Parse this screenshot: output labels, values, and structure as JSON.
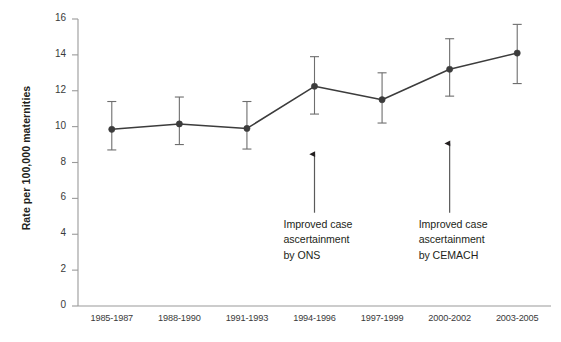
{
  "chart_data": {
    "type": "line",
    "title": "",
    "xlabel": "",
    "ylabel": "Rate per 100,000 maternities",
    "categories": [
      "1985-1987",
      "1988-1990",
      "1991-1993",
      "1994-1996",
      "1997-1999",
      "2000-2002",
      "2003-2005"
    ],
    "values": [
      9.85,
      10.15,
      9.9,
      12.25,
      11.5,
      13.2,
      14.1
    ],
    "errors_low": [
      8.7,
      9.0,
      8.75,
      10.7,
      10.2,
      11.7,
      12.4
    ],
    "errors_high": [
      11.4,
      11.65,
      11.4,
      13.9,
      13.0,
      14.9,
      15.7
    ],
    "ylim": [
      0,
      16
    ],
    "yticks": [
      0,
      2,
      4,
      6,
      8,
      10,
      12,
      14,
      16
    ],
    "ytick_labels": [
      "0",
      "2",
      "4",
      "6",
      "8",
      "10",
      "12",
      "14",
      "16"
    ],
    "grid": false,
    "legend": null,
    "series_color": "#3c3c3c",
    "marker": "filled-circle",
    "errorbar_style": "capped-vertical",
    "annotations": [
      {
        "id": "ons",
        "text": "Improved case\nascertainment\nby ONS",
        "target_category": "1994-1996",
        "arrow_from_value": 5.2,
        "arrow_to_value": 8.8
      },
      {
        "id": "cemach",
        "text": "Improved case\nascertainment\nby CEMACH",
        "target_category": "2000-2002",
        "arrow_from_value": 5.2,
        "arrow_to_value": 9.4
      }
    ]
  },
  "axes": {
    "axis_color": "#9a9a9a",
    "tick_color": "#9a9a9a",
    "text_color": "#3a3a3a"
  }
}
